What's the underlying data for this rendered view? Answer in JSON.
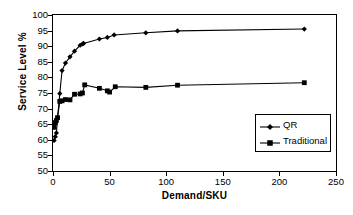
{
  "chart_data": {
    "type": "line",
    "title": "",
    "xlabel": "Demand/SKU",
    "ylabel": "Service Level %",
    "xlim": [
      0,
      250
    ],
    "ylim": [
      50,
      100
    ],
    "xticks": [
      0,
      50,
      100,
      150,
      200,
      250
    ],
    "yticks": [
      50,
      55,
      60,
      65,
      70,
      75,
      80,
      85,
      90,
      95,
      100
    ],
    "grid": false,
    "legend_position": "lower-right",
    "series": [
      {
        "name": "QR",
        "marker": "diamond",
        "color": "#000000",
        "x": [
          1,
          2,
          3,
          4,
          6,
          8,
          11,
          15,
          19,
          24,
          26,
          27,
          41,
          48,
          54,
          82,
          110,
          222
        ],
        "y": [
          59.8,
          61.0,
          62.2,
          67.0,
          74.8,
          82.2,
          84.6,
          86.6,
          88.4,
          90.3,
          90.7,
          90.9,
          92.3,
          92.8,
          93.6,
          94.3,
          94.9,
          95.5
        ]
      },
      {
        "name": "Traditional",
        "marker": "square",
        "color": "#000000",
        "x": [
          1,
          2,
          3,
          4,
          6,
          8,
          11,
          15,
          19,
          24,
          26,
          28,
          41,
          48,
          50,
          55,
          82,
          110,
          222
        ],
        "y": [
          64.0,
          65.5,
          66.2,
          67.1,
          72.3,
          72.5,
          72.9,
          72.8,
          74.6,
          74.7,
          75.0,
          77.6,
          76.5,
          75.7,
          75.3,
          77.0,
          76.8,
          77.5,
          78.3
        ]
      }
    ]
  },
  "legend": {
    "items": [
      {
        "label": "QR",
        "marker": "diamond"
      },
      {
        "label": "Traditional",
        "marker": "square"
      }
    ]
  }
}
